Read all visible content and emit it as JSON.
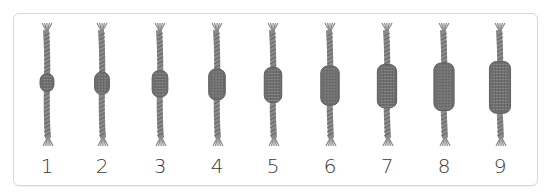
{
  "panel": {
    "description": "Sequence of ropes with knots increasing in size",
    "items": [
      {
        "label": "1",
        "knot_size": 1
      },
      {
        "label": "2",
        "knot_size": 2
      },
      {
        "label": "3",
        "knot_size": 3
      },
      {
        "label": "4",
        "knot_size": 4
      },
      {
        "label": "5",
        "knot_size": 5
      },
      {
        "label": "6",
        "knot_size": 6
      },
      {
        "label": "7",
        "knot_size": 7
      },
      {
        "label": "8",
        "knot_size": 8
      },
      {
        "label": "9",
        "knot_size": 9
      }
    ],
    "colors": {
      "rope": "#8a8a8a",
      "rope_dark": "#5e5e5e",
      "knot": "#6f6f6f",
      "border": "#d8d8d8",
      "text": "#3a3a3a"
    }
  }
}
